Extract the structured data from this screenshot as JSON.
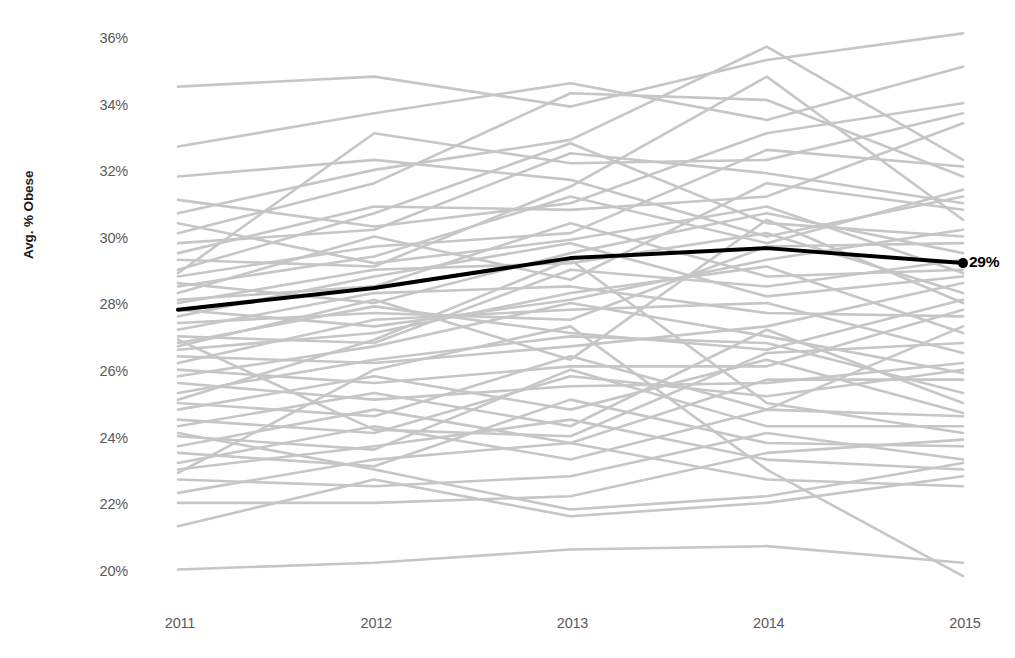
{
  "chart_data": {
    "type": "line",
    "title": "",
    "subtitle": "",
    "xlabel": "",
    "ylabel": "Avg. % Obese",
    "x": [
      2011,
      2012,
      2013,
      2014,
      2015
    ],
    "xtick_labels": [
      "2011",
      "2012",
      "2013",
      "2014",
      "2015"
    ],
    "ytick_labels": [
      "36%",
      "34%",
      "32%",
      "30%",
      "28%",
      "26%",
      "24%",
      "22%",
      "20%"
    ],
    "ytick_values": [
      36,
      34,
      32,
      30,
      28,
      26,
      24,
      22,
      20
    ],
    "ylim": [
      19.2,
      36.6
    ],
    "xlim": [
      2011,
      2015
    ],
    "grid": false,
    "legend": false,
    "legend_position": "none",
    "annotations": [
      {
        "text": "29%",
        "x": 2015,
        "y": 29.3,
        "series": "Average",
        "marker": "dot"
      }
    ],
    "colors": {
      "highlight_line": "#000000",
      "background_lines": "#c6c6c6",
      "tick_text": "#5a5a5a",
      "axis_title": "#1a1a1a",
      "plot_background": "#ffffff"
    },
    "highlight_series": {
      "name": "Average",
      "color": "#000000",
      "width": 4,
      "end_marker": true,
      "values": [
        27.9,
        28.55,
        29.45,
        29.75,
        29.3
      ]
    },
    "background_series": [
      {
        "name": "S01",
        "values": [
          34.6,
          34.9,
          34.0,
          35.4,
          36.2
        ]
      },
      {
        "name": "S02",
        "values": [
          32.8,
          33.8,
          34.7,
          33.6,
          35.2
        ]
      },
      {
        "name": "S03",
        "values": [
          31.2,
          30.4,
          31.1,
          33.2,
          34.1
        ]
      },
      {
        "name": "S04",
        "values": [
          30.8,
          32.1,
          33.0,
          35.8,
          32.4
        ]
      },
      {
        "name": "S05",
        "values": [
          30.2,
          31.7,
          34.4,
          34.2,
          31.9
        ]
      },
      {
        "name": "S06",
        "values": [
          29.9,
          30.3,
          32.6,
          32.0,
          31.1
        ]
      },
      {
        "name": "S07",
        "values": [
          29.6,
          31.0,
          30.9,
          31.3,
          33.5
        ]
      },
      {
        "name": "S08",
        "values": [
          29.4,
          29.2,
          31.6,
          34.9,
          30.6
        ]
      },
      {
        "name": "S09",
        "values": [
          29.1,
          30.8,
          32.9,
          30.5,
          30.1
        ]
      },
      {
        "name": "S10",
        "values": [
          28.9,
          29.8,
          30.2,
          32.7,
          32.2
        ]
      },
      {
        "name": "S11",
        "values": [
          28.7,
          28.1,
          29.6,
          30.8,
          29.6
        ]
      },
      {
        "name": "S12",
        "values": [
          28.6,
          29.5,
          31.3,
          29.9,
          31.5
        ]
      },
      {
        "name": "S13",
        "values": [
          28.4,
          30.1,
          28.8,
          31.7,
          30.9
        ]
      },
      {
        "name": "S14",
        "values": [
          28.2,
          28.6,
          30.5,
          28.9,
          29.1
        ]
      },
      {
        "name": "S15",
        "values": [
          28.1,
          29.1,
          29.3,
          30.2,
          28.4
        ]
      },
      {
        "name": "S16",
        "values": [
          27.9,
          27.4,
          28.2,
          29.4,
          30.3
        ]
      },
      {
        "name": "S17",
        "values": [
          27.7,
          28.9,
          29.9,
          28.3,
          28.9
        ]
      },
      {
        "name": "S18",
        "values": [
          27.5,
          27.8,
          27.6,
          29.8,
          29.9
        ]
      },
      {
        "name": "S19",
        "values": [
          27.3,
          28.4,
          28.6,
          27.8,
          27.7
        ]
      },
      {
        "name": "S20",
        "values": [
          27.1,
          26.9,
          29.1,
          28.6,
          29.4
        ]
      },
      {
        "name": "S21",
        "values": [
          26.9,
          28.0,
          27.2,
          26.7,
          28.2
        ]
      },
      {
        "name": "S22",
        "values": [
          26.7,
          27.2,
          28.4,
          29.2,
          27.2
        ]
      },
      {
        "name": "S23",
        "values": [
          26.5,
          26.3,
          26.8,
          27.4,
          28.7
        ]
      },
      {
        "name": "S24",
        "values": [
          26.3,
          27.6,
          27.9,
          28.1,
          26.6
        ]
      },
      {
        "name": "S25",
        "values": [
          26.1,
          25.7,
          26.2,
          26.2,
          27.9
        ]
      },
      {
        "name": "S26",
        "values": [
          25.9,
          26.8,
          28.1,
          27.1,
          26.0
        ]
      },
      {
        "name": "S27",
        "values": [
          25.7,
          25.2,
          25.6,
          25.7,
          26.3
        ]
      },
      {
        "name": "S28",
        "values": [
          25.4,
          26.4,
          27.1,
          26.9,
          25.4
        ]
      },
      {
        "name": "S29",
        "values": [
          25.1,
          24.7,
          26.5,
          24.9,
          27.4
        ]
      },
      {
        "name": "S30",
        "values": [
          24.9,
          25.9,
          24.9,
          26.4,
          24.8
        ]
      },
      {
        "name": "S31",
        "values": [
          24.6,
          24.2,
          25.9,
          25.3,
          26.1
        ]
      },
      {
        "name": "S32",
        "values": [
          24.4,
          25.4,
          24.4,
          27.3,
          25.1
        ]
      },
      {
        "name": "S33",
        "values": [
          24.1,
          23.7,
          26.1,
          24.4,
          24.4
        ]
      },
      {
        "name": "S34",
        "values": [
          23.8,
          24.9,
          23.9,
          25.8,
          25.8
        ]
      },
      {
        "name": "S35",
        "values": [
          23.6,
          23.2,
          25.2,
          23.9,
          23.8
        ]
      },
      {
        "name": "S36",
        "values": [
          23.3,
          24.4,
          23.4,
          24.9,
          24.7
        ]
      },
      {
        "name": "S37",
        "values": [
          23.1,
          23.8,
          24.6,
          23.4,
          23.1
        ]
      },
      {
        "name": "S38",
        "values": [
          22.8,
          22.6,
          22.9,
          24.2,
          23.4
        ]
      },
      {
        "name": "S39",
        "values": [
          22.4,
          23.4,
          23.9,
          22.8,
          22.6
        ]
      },
      {
        "name": "S40",
        "values": [
          22.1,
          22.1,
          22.3,
          23.6,
          24.0
        ]
      },
      {
        "name": "S41",
        "values": [
          21.4,
          22.8,
          21.7,
          22.1,
          22.9
        ]
      },
      {
        "name": "S42",
        "values": [
          24.2,
          23.1,
          21.9,
          22.3,
          23.3
        ]
      },
      {
        "name": "S43",
        "values": [
          20.1,
          20.3,
          20.7,
          20.8,
          20.3
        ]
      },
      {
        "name": "S44",
        "values": [
          30.5,
          29.3,
          30.0,
          31.0,
          29.0
        ]
      },
      {
        "name": "S45",
        "values": [
          31.9,
          32.4,
          31.8,
          30.1,
          31.3
        ]
      },
      {
        "name": "S46",
        "values": [
          29.0,
          33.2,
          32.3,
          32.4,
          33.8
        ]
      },
      {
        "name": "S47",
        "values": [
          26.8,
          28.2,
          26.4,
          30.6,
          28.1
        ]
      },
      {
        "name": "S48",
        "values": [
          25.2,
          27.0,
          29.4,
          25.1,
          24.2
        ]
      },
      {
        "name": "S49",
        "values": [
          27.0,
          24.3,
          24.1,
          26.6,
          26.9
        ]
      },
      {
        "name": "S50",
        "values": [
          23.0,
          26.1,
          27.4,
          23.1,
          19.9
        ]
      }
    ]
  }
}
